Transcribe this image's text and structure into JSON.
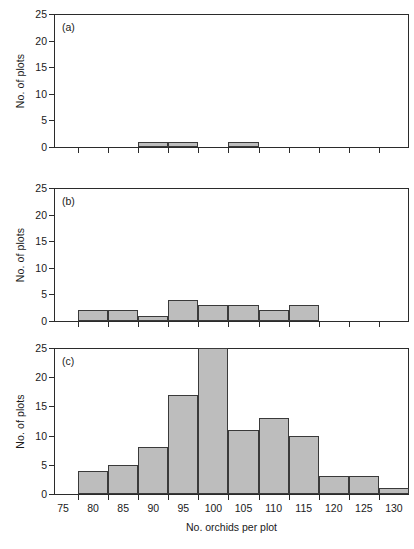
{
  "figure": {
    "background_color": "#ffffff",
    "bar_fill_color": "#bdbdbd",
    "bar_edge_color": "#3a3a3a",
    "axis_color": "#2b2b2b"
  },
  "chart_data": [
    {
      "type": "bar",
      "panel": "(a)",
      "title": "",
      "xlabel": "",
      "ylabel": "No. of plots",
      "xlim": [
        73.5,
        132.5
      ],
      "ylim": [
        0,
        25
      ],
      "yticks": [
        0,
        5,
        10,
        15,
        20,
        25
      ],
      "xticks": [
        75,
        80,
        85,
        90,
        95,
        100,
        105,
        110,
        115,
        120,
        125,
        130
      ],
      "bin_width": 5,
      "grid": false,
      "legend": "none",
      "categories": [
        75,
        80,
        85,
        90,
        95,
        100,
        105,
        110,
        115,
        120,
        125,
        130
      ],
      "values": [
        0,
        0,
        0,
        1,
        1,
        0,
        1,
        0,
        0,
        0,
        0,
        0
      ]
    },
    {
      "type": "bar",
      "panel": "(b)",
      "title": "",
      "xlabel": "",
      "ylabel": "No. of plots",
      "xlim": [
        73.5,
        132.5
      ],
      "ylim": [
        0,
        25
      ],
      "yticks": [
        0,
        5,
        10,
        15,
        20,
        25
      ],
      "xticks": [
        75,
        80,
        85,
        90,
        95,
        100,
        105,
        110,
        115,
        120,
        125,
        130
      ],
      "bin_width": 5,
      "grid": false,
      "legend": "none",
      "categories": [
        75,
        80,
        85,
        90,
        95,
        100,
        105,
        110,
        115,
        120,
        125,
        130
      ],
      "values": [
        0,
        2,
        2,
        1,
        4,
        3,
        3,
        2,
        3,
        0,
        0,
        0
      ]
    },
    {
      "type": "bar",
      "panel": "(c)",
      "title": "",
      "xlabel": "No. orchids per plot",
      "ylabel": "No. of plots",
      "xlim": [
        73.5,
        132.5
      ],
      "ylim": [
        0,
        25
      ],
      "yticks": [
        0,
        5,
        10,
        15,
        20,
        25
      ],
      "xticks": [
        75,
        80,
        85,
        90,
        95,
        100,
        105,
        110,
        115,
        120,
        125,
        130
      ],
      "bin_width": 5,
      "grid": false,
      "legend": "none",
      "categories": [
        75,
        80,
        85,
        90,
        95,
        100,
        105,
        110,
        115,
        120,
        125,
        130
      ],
      "values": [
        0,
        4,
        5,
        8,
        17,
        25,
        11,
        13,
        10,
        3,
        3,
        1
      ]
    }
  ]
}
